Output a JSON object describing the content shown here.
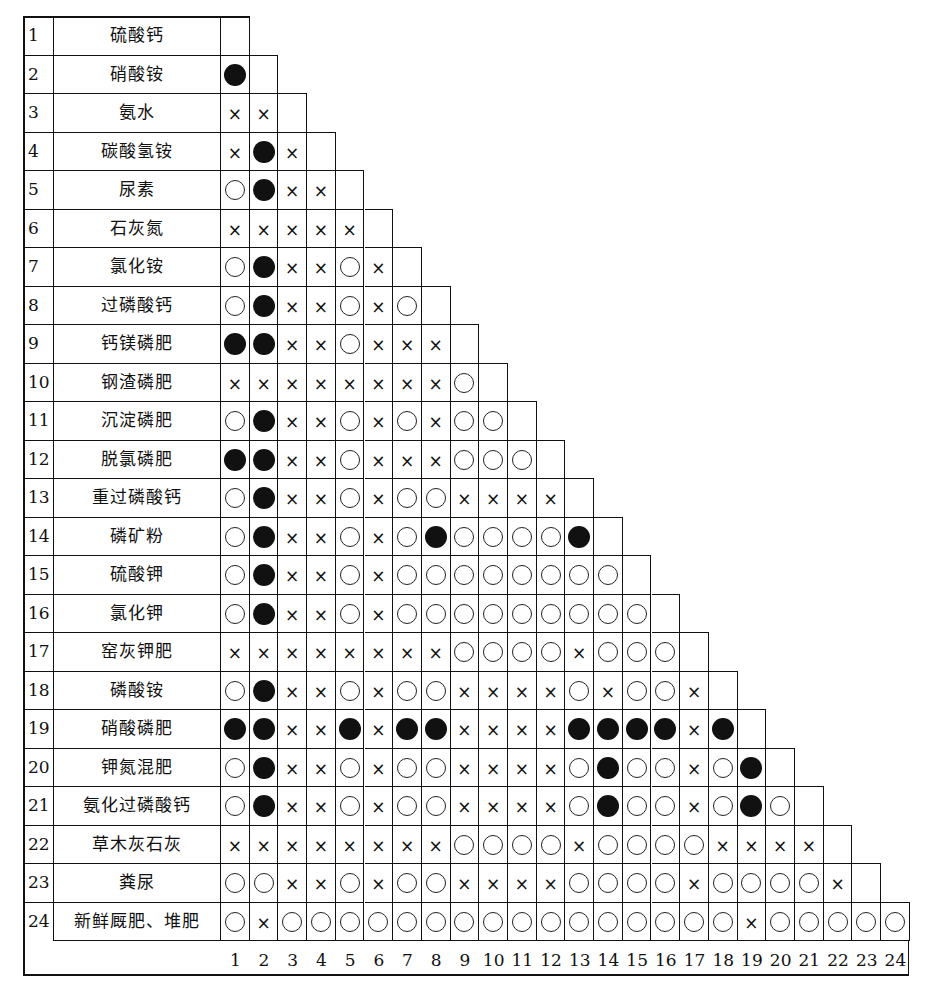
{
  "legend": {
    "filled": "●",
    "open": "○",
    "cross": "×"
  },
  "rows": [
    {
      "num": "1",
      "name": "硫酸钙",
      "cells": ""
    },
    {
      "num": "2",
      "name": "硝酸铵",
      "cells": "F"
    },
    {
      "num": "3",
      "name": "氨水",
      "cells": "XX"
    },
    {
      "num": "4",
      "name": "碳酸氢铵",
      "cells": "XFX"
    },
    {
      "num": "5",
      "name": "尿素",
      "cells": "OFXX"
    },
    {
      "num": "6",
      "name": "石灰氮",
      "cells": "XXXXX"
    },
    {
      "num": "7",
      "name": "氯化铵",
      "cells": "OFXXOX"
    },
    {
      "num": "8",
      "name": "过磷酸钙",
      "cells": "OFXXOXO"
    },
    {
      "num": "9",
      "name": "钙镁磷肥",
      "cells": "FFXXOXXX"
    },
    {
      "num": "10",
      "name": "钢渣磷肥",
      "cells": "XXXXXXXXO"
    },
    {
      "num": "11",
      "name": "沉淀磷肥",
      "cells": "OFXXOXOXOO"
    },
    {
      "num": "12",
      "name": "脱氯磷肥",
      "cells": "FFXXOXXXOOO"
    },
    {
      "num": "13",
      "name": "重过磷酸钙",
      "cells": "OFXXOXOOXXXX"
    },
    {
      "num": "14",
      "name": "磷矿粉",
      "cells": "OFXXOXOFOOOOF"
    },
    {
      "num": "15",
      "name": "硫酸钾",
      "cells": "OFXXOXOOOOOOOO"
    },
    {
      "num": "16",
      "name": "氯化钾",
      "cells": "OFXXOXOOOOOOOOO"
    },
    {
      "num": "17",
      "name": "窑灰钾肥",
      "cells": "XXXXXXXXOOOOXOOO"
    },
    {
      "num": "18",
      "name": "磷酸铵",
      "cells": "OFXXOXOOXXXXOXOOX"
    },
    {
      "num": "19",
      "name": "硝酸磷肥",
      "cells": "FFXXFXFFXXXXFFFFXF"
    },
    {
      "num": "20",
      "name": "钾氮混肥",
      "cells": "OFXXOXOOXXXXOFOOXOF"
    },
    {
      "num": "21",
      "name": "氨化过磷酸钙",
      "cells": "OFXXOXOOXXXXOFOOXOFO"
    },
    {
      "num": "22",
      "name": "草木灰石灰",
      "cells": "XXXXXXXXOOOOXOOOOXXXX"
    },
    {
      "num": "23",
      "name": "粪尿",
      "cells": "OOXXOXOOXXXXOOOOXOOOOX"
    },
    {
      "num": "24",
      "name": "新鲜厩肥、堆肥",
      "cells": "OXOOOOOOOOOOOOOOOOXOOOOO"
    }
  ],
  "columns": [
    "1",
    "2",
    "3",
    "4",
    "5",
    "6",
    "7",
    "8",
    "9",
    "10",
    "11",
    "12",
    "13",
    "14",
    "15",
    "16",
    "17",
    "18",
    "19",
    "20",
    "21",
    "22",
    "23",
    "24"
  ]
}
